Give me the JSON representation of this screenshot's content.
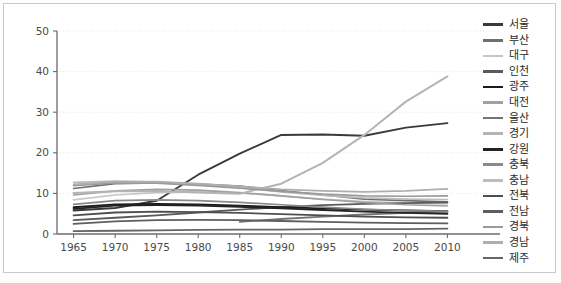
{
  "chart_data": {
    "type": "line",
    "title": "",
    "xlabel": "",
    "ylabel": "",
    "x": [
      1965,
      1970,
      1975,
      1980,
      1985,
      1990,
      1995,
      2000,
      2005,
      2010
    ],
    "xlim": [
      1963,
      2012
    ],
    "ylim": [
      0,
      50
    ],
    "xticks": [
      "1965",
      "1970",
      "1975",
      "1980",
      "1985",
      "1990",
      "1995",
      "2000",
      "2005",
      "2010"
    ],
    "yticks": [
      "0",
      "10",
      "20",
      "30",
      "40",
      "50"
    ],
    "grid": true,
    "legend_position": "right",
    "series": [
      {
        "name": "서울",
        "color": "#3a3a3a",
        "width": 1.9,
        "x": [
          1965,
          1970,
          1975,
          1980,
          1985,
          1990,
          1995,
          2000,
          2005,
          2010
        ],
        "values": [
          5.8,
          6.4,
          8.2,
          14.6,
          19.8,
          24.4,
          24.5,
          24.2,
          26.2,
          27.3
        ]
      },
      {
        "name": "부산",
        "color": "#6f6f6f",
        "width": 1.7,
        "x": [
          1965,
          1970,
          1975,
          1980,
          1985,
          1990,
          1995,
          2000,
          2005,
          2010
        ],
        "values": [
          11.2,
          12.4,
          12.6,
          12.3,
          11.8,
          10.7,
          9.6,
          8.6,
          8.2,
          7.9
        ]
      },
      {
        "name": "대구",
        "color": "#c6c6c6",
        "width": 1.7,
        "x": [
          1965,
          1970,
          1975,
          1980,
          1985,
          1990,
          1995,
          2000,
          2005,
          2010
        ],
        "values": [
          8.4,
          9.6,
          10.2,
          10.4,
          10.1,
          9.4,
          8.6,
          8.0,
          7.6,
          7.4
        ]
      },
      {
        "name": "인천",
        "color": "#5a5a5a",
        "width": 1.8,
        "x": [
          1965,
          1970,
          1975,
          1980,
          1985,
          1990,
          1995,
          2000,
          2005,
          2010
        ],
        "values": [
          3.4,
          4.0,
          4.6,
          5.3,
          6.0,
          6.6,
          7.1,
          7.4,
          7.6,
          7.8
        ]
      },
      {
        "name": "광주",
        "color": "#1c1c1c",
        "width": 1.9,
        "x": [
          1965,
          1970,
          1975,
          1980,
          1985,
          1990,
          1995,
          2000,
          2005,
          2010
        ],
        "values": [
          6.6,
          7.3,
          7.4,
          7.3,
          7.0,
          6.6,
          6.3,
          6.0,
          5.8,
          5.6
        ]
      },
      {
        "name": "대전",
        "color": "#a0a0a0",
        "width": 1.7,
        "x": [
          1965,
          1970,
          1975,
          1980,
          1985,
          1990,
          1995,
          2000,
          2005,
          2010
        ],
        "values": [
          9.6,
          10.6,
          11.0,
          10.8,
          10.2,
          9.4,
          8.5,
          7.8,
          7.2,
          6.9
        ]
      },
      {
        "name": "울산",
        "color": "#747474",
        "width": 1.8,
        "x": [
          1985,
          1990,
          1995,
          2000,
          2005,
          2010
        ],
        "values": [
          3.0,
          3.7,
          4.3,
          4.8,
          5.2,
          5.5
        ]
      },
      {
        "name": "경기",
        "color": "#b4b4b4",
        "width": 2.0,
        "x": [
          1965,
          1970,
          1975,
          1980,
          1985,
          1990,
          1995,
          2000,
          2005,
          2010
        ],
        "values": [
          10.1,
          10.5,
          10.6,
          10.2,
          9.9,
          12.4,
          17.5,
          24.4,
          32.6,
          38.8
        ]
      },
      {
        "name": "강원",
        "color": "#232323",
        "width": 1.9,
        "x": [
          1965,
          1970,
          1975,
          1980,
          1985,
          1990,
          1995,
          2000,
          2005,
          2010
        ],
        "values": [
          6.2,
          7.0,
          7.1,
          7.0,
          6.7,
          6.3,
          5.9,
          5.5,
          5.2,
          5.0
        ]
      },
      {
        "name": "충북",
        "color": "#8a8a8a",
        "width": 1.7,
        "x": [
          1965,
          1970,
          1975,
          1980,
          1985,
          1990,
          1995,
          2000,
          2005,
          2010
        ],
        "values": [
          7.3,
          8.2,
          8.4,
          8.2,
          7.8,
          7.2,
          6.6,
          6.1,
          5.8,
          5.6
        ]
      },
      {
        "name": "충남",
        "color": "#bdbdbd",
        "width": 1.7,
        "x": [
          1965,
          1970,
          1975,
          1980,
          1985,
          1990,
          1995,
          2000,
          2005,
          2010
        ],
        "values": [
          12.7,
          13.0,
          12.8,
          12.2,
          11.4,
          10.4,
          9.5,
          8.9,
          8.6,
          8.5
        ]
      },
      {
        "name": "전북",
        "color": "#4e4e4e",
        "width": 1.8,
        "x": [
          1965,
          1970,
          1975,
          1980,
          1985,
          1990,
          1995,
          2000,
          2005,
          2010
        ],
        "values": [
          4.6,
          5.3,
          5.5,
          5.4,
          5.2,
          4.9,
          4.6,
          4.3,
          4.1,
          4.0
        ]
      },
      {
        "name": "전남",
        "color": "#5e5e5e",
        "width": 1.8,
        "x": [
          1965,
          1970,
          1975,
          1980,
          1985,
          1990,
          1995,
          2000,
          2005,
          2010
        ],
        "values": [
          2.5,
          3.1,
          3.4,
          3.5,
          3.4,
          3.2,
          3.0,
          2.8,
          2.7,
          2.6
        ]
      },
      {
        "name": "경북",
        "color": "#9a9a9a",
        "width": 1.7,
        "x": [
          1965,
          1970,
          1975,
          1980,
          1985,
          1990,
          1995,
          2000,
          2005,
          2010
        ],
        "values": [
          11.9,
          12.6,
          12.5,
          12.0,
          11.3,
          10.5,
          9.8,
          9.4,
          9.3,
          9.4
        ]
      },
      {
        "name": "경남",
        "color": "#aeaeae",
        "width": 1.8,
        "x": [
          1965,
          1970,
          1975,
          1980,
          1985,
          1990,
          1995,
          2000,
          2005,
          2010
        ],
        "values": [
          12.2,
          12.9,
          12.9,
          12.4,
          11.7,
          11.0,
          10.6,
          10.4,
          10.6,
          11.1
        ]
      },
      {
        "name": "제주",
        "color": "#666666",
        "width": 1.8,
        "x": [
          1965,
          1970,
          1975,
          1980,
          1985,
          1990,
          1995,
          2000,
          2005,
          2010
        ],
        "values": [
          0.7,
          0.8,
          0.9,
          1.0,
          1.1,
          1.1,
          1.2,
          1.2,
          1.2,
          1.3
        ]
      }
    ]
  }
}
